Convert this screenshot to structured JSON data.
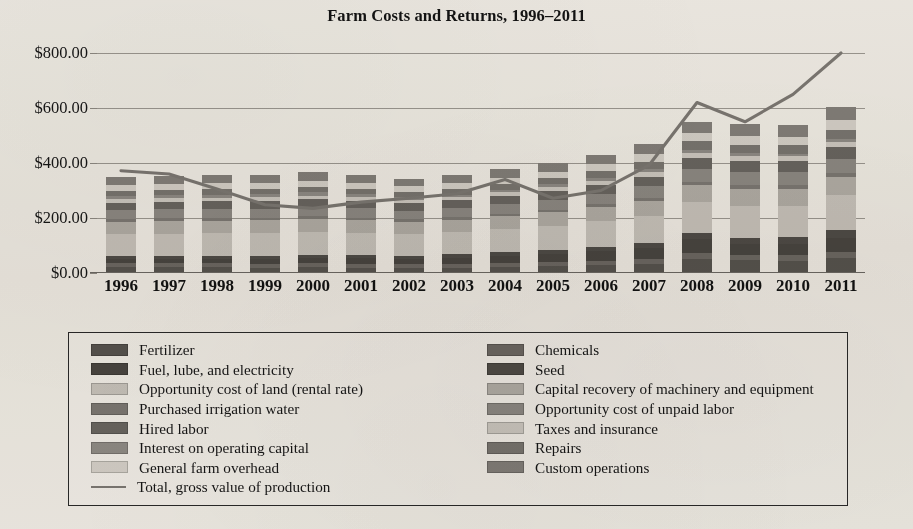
{
  "chart_data": {
    "type": "bar",
    "subtype": "stacked-bar-with-line-overlay",
    "title": "Farm Costs and Returns, 1996–2011",
    "xlabel": "",
    "ylabel": "",
    "ylim": [
      0,
      800
    ],
    "ytick_values": [
      0,
      200,
      400,
      600,
      800
    ],
    "ytick_labels": [
      "$0.00",
      "$200.00",
      "$400.00",
      "$600.00",
      "$800.00"
    ],
    "grid": true,
    "grid_axis": "y",
    "legend_position": "below-plot",
    "legend_columns": 2,
    "categories": [
      "1996",
      "1997",
      "1998",
      "1999",
      "2000",
      "2001",
      "2002",
      "2003",
      "2004",
      "2005",
      "2006",
      "2007",
      "2008",
      "2009",
      "2010",
      "2011"
    ],
    "series": [
      {
        "name": "Fertilizer",
        "color": "#585551",
        "values": [
          21,
          21,
          21,
          20,
          21,
          20,
          19,
          20,
          22,
          24,
          28,
          34,
          52,
          46,
          44,
          56
        ]
      },
      {
        "name": "Chemicals",
        "color": "#6e6a66",
        "values": [
          14,
          14,
          14,
          14,
          14,
          14,
          13,
          14,
          14,
          15,
          16,
          17,
          20,
          20,
          20,
          22
        ]
      },
      {
        "name": "Fuel, lube, and electricity",
        "color": "#4a4743",
        "values": [
          16,
          16,
          15,
          16,
          19,
          21,
          19,
          22,
          26,
          31,
          36,
          40,
          53,
          38,
          43,
          50
        ]
      },
      {
        "name": "Seed",
        "color": "#504d49",
        "values": [
          12,
          12,
          12,
          12,
          12,
          12,
          12,
          13,
          14,
          15,
          16,
          18,
          22,
          24,
          24,
          27
        ]
      },
      {
        "name": "Opportunity cost of land (rental rate)",
        "color": "#c9c6c1",
        "values": [
          78,
          80,
          82,
          83,
          84,
          80,
          78,
          79,
          83,
          87,
          92,
          99,
          112,
          116,
          114,
          127
        ]
      },
      {
        "name": "Capital recovery of machinery and equipment",
        "color": "#b3b0ab",
        "values": [
          46,
          47,
          47,
          47,
          47,
          46,
          45,
          46,
          47,
          49,
          51,
          54,
          60,
          62,
          62,
          66
        ]
      },
      {
        "name": "Purchased irrigation water",
        "color": "#7d7a76",
        "values": [
          9,
          9,
          9,
          9,
          9,
          9,
          9,
          9,
          10,
          10,
          11,
          12,
          13,
          14,
          14,
          15
        ]
      },
      {
        "name": "Opportunity cost of unpaid labor",
        "color": "#8e8b87",
        "values": [
          33,
          33,
          33,
          33,
          34,
          33,
          32,
          33,
          35,
          36,
          38,
          41,
          46,
          48,
          47,
          51
        ]
      },
      {
        "name": "Hired labor",
        "color": "#6a6763",
        "values": [
          27,
          28,
          28,
          28,
          29,
          28,
          27,
          28,
          29,
          31,
          32,
          35,
          39,
          41,
          40,
          44
        ]
      },
      {
        "name": "Taxes and insurance",
        "color": "#cecbc6",
        "values": [
          13,
          13,
          13,
          13,
          13,
          13,
          13,
          13,
          14,
          14,
          15,
          16,
          18,
          18,
          18,
          20
        ]
      },
      {
        "name": "Interest on operating capital",
        "color": "#908d89",
        "values": [
          11,
          11,
          11,
          11,
          12,
          10,
          8,
          8,
          9,
          11,
          12,
          13,
          14,
          9,
          8,
          9
        ]
      },
      {
        "name": "Repairs",
        "color": "#7a7773",
        "values": [
          19,
          19,
          19,
          19,
          20,
          19,
          19,
          20,
          21,
          22,
          24,
          26,
          30,
          31,
          31,
          34
        ]
      },
      {
        "name": "General farm overhead",
        "color": "#d6d3ce",
        "values": [
          22,
          22,
          22,
          22,
          22,
          22,
          21,
          22,
          23,
          24,
          25,
          27,
          30,
          31,
          31,
          34
        ]
      },
      {
        "name": "Custom operations",
        "color": "#84817d",
        "values": [
          29,
          29,
          29,
          29,
          30,
          29,
          28,
          29,
          31,
          32,
          34,
          37,
          42,
          44,
          43,
          48
        ]
      }
    ],
    "overlay_line": {
      "name": "Total, gross value of production",
      "color": "#7d7a76",
      "values": [
        372,
        360,
        305,
        248,
        235,
        258,
        272,
        288,
        340,
        272,
        300,
        392,
        620,
        550,
        650,
        800
      ]
    },
    "bar_totals": [
      350,
      354,
      355,
      356,
      366,
      336,
      323,
      356,
      368,
      371,
      400,
      439,
      521,
      542,
      539,
      595
    ]
  },
  "legend": {
    "left_column": [
      {
        "label": "Fertilizer",
        "swatch_type": "box",
        "color": "#585551"
      },
      {
        "label": "Fuel, lube, and electricity",
        "swatch_type": "box",
        "color": "#4a4743"
      },
      {
        "label": "Opportunity cost of land (rental rate)",
        "swatch_type": "box",
        "color": "#c9c6c1"
      },
      {
        "label": "Purchased irrigation water",
        "swatch_type": "box",
        "color": "#7d7a76"
      },
      {
        "label": "Hired labor",
        "swatch_type": "box",
        "color": "#6a6763"
      },
      {
        "label": "Interest on operating capital",
        "swatch_type": "box",
        "color": "#908d89"
      },
      {
        "label": "General farm overhead",
        "swatch_type": "box",
        "color": "#d6d3ce"
      },
      {
        "label": "Total, gross value of production",
        "swatch_type": "line",
        "color": "#7d7a76"
      }
    ],
    "right_column": [
      {
        "label": "Chemicals",
        "swatch_type": "box",
        "color": "#6e6a66"
      },
      {
        "label": "Seed",
        "swatch_type": "box",
        "color": "#504d49"
      },
      {
        "label": "Capital recovery of machinery and equipment",
        "swatch_type": "box",
        "color": "#b3b0ab"
      },
      {
        "label": "Opportunity cost of unpaid labor",
        "swatch_type": "box",
        "color": "#8e8b87"
      },
      {
        "label": "Taxes and insurance",
        "swatch_type": "box",
        "color": "#cecbc6"
      },
      {
        "label": "Repairs",
        "swatch_type": "box",
        "color": "#7a7773"
      },
      {
        "label": "Custom operations",
        "swatch_type": "box",
        "color": "#84817d"
      }
    ]
  },
  "style": {
    "background": "#f2f0ec",
    "grid_color": "#9d9a95",
    "axis_color": "#6e6b67",
    "text_color": "#161616",
    "legend_border": "#2a2a2a"
  }
}
